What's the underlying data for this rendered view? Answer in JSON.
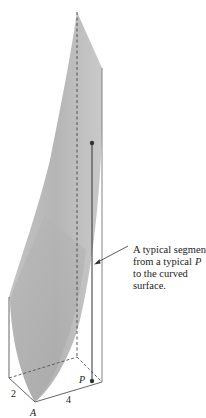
{
  "figure": {
    "surface_color": "#b9b9b9",
    "line_color": "#555555"
  },
  "labels": {
    "width_label": "2",
    "length_label": "4",
    "corner_label": "A",
    "point_label": "P"
  },
  "annotation": {
    "lines": [
      "A typical segment",
      "from a typical",
      "to the curved",
      "surface."
    ],
    "line2_var": "P"
  }
}
